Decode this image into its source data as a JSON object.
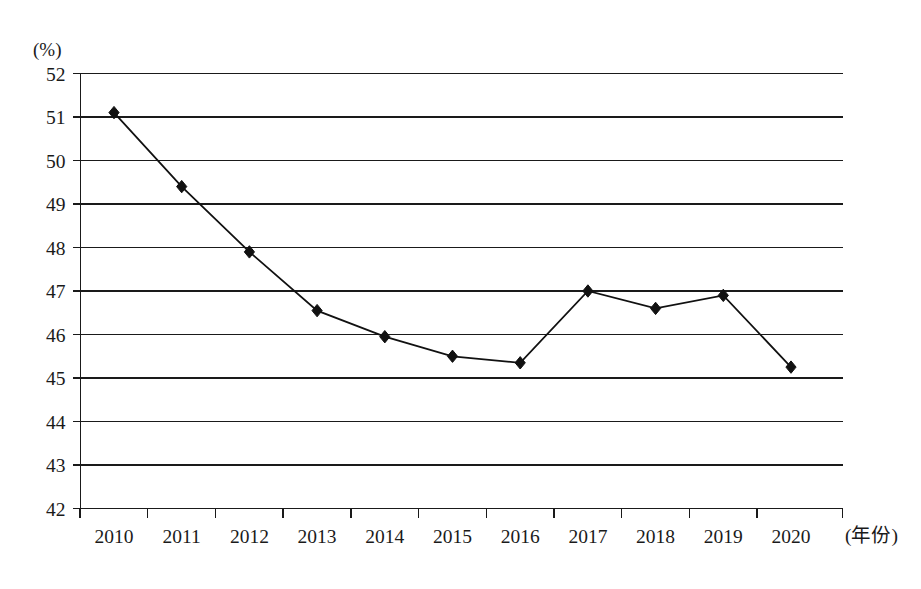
{
  "chart_data": {
    "type": "line",
    "title": "",
    "subtitle": "",
    "xlabel": "(年份)",
    "ylabel": "(%)",
    "y_unit_label": "(%)",
    "x_unit_label": "(年份)",
    "categories": [
      "2010",
      "2011",
      "2012",
      "2013",
      "2014",
      "2015",
      "2016",
      "2017",
      "2018",
      "2019",
      "2020"
    ],
    "x": [
      2010,
      2011,
      2012,
      2013,
      2014,
      2015,
      2016,
      2017,
      2018,
      2019,
      2020
    ],
    "values": [
      51.1,
      49.4,
      47.9,
      46.55,
      45.95,
      45.5,
      45.35,
      47.0,
      46.6,
      46.9,
      45.25
    ],
    "series": [
      {
        "name": "",
        "values": [
          51.1,
          49.4,
          47.9,
          46.55,
          45.95,
          45.5,
          45.35,
          47.0,
          46.6,
          46.9,
          45.25
        ],
        "marker": "diamond",
        "color": "#111111"
      }
    ],
    "ylim": [
      42,
      52
    ],
    "y_ticks": [
      42,
      43,
      44,
      45,
      46,
      47,
      48,
      49,
      50,
      51,
      52
    ],
    "y_tick_labels": [
      "42",
      "43",
      "44",
      "45",
      "46",
      "47",
      "48",
      "49",
      "50",
      "51",
      "52"
    ],
    "x_ticks": [
      "2010",
      "2011",
      "2012",
      "2013",
      "2014",
      "2015",
      "2016",
      "2017",
      "2018",
      "2019",
      "2020"
    ],
    "grid": true,
    "grid_orientation": "horizontal",
    "legend": false,
    "legend_position": "none",
    "annotations": [],
    "line_color": "#111111",
    "axis_color": "#1a1a1a",
    "background_color": "#ffffff"
  }
}
